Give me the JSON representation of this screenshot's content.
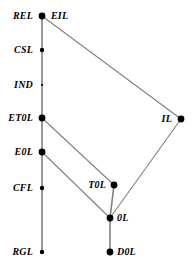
{
  "diagram": {
    "type": "hasse-hierarchy-graph",
    "title": "",
    "canvas": {
      "width": 195,
      "height": 267,
      "background": "#ffffff"
    },
    "style": {
      "edge_color": "#808080",
      "node_color": "#000000",
      "label_color": "#000000",
      "edge_width": 1.1,
      "spine_width": 1.6
    },
    "nodes": [
      {
        "id": "REL",
        "label": "REL",
        "x": 42,
        "y": 16,
        "r": 3.4,
        "label_side": "left",
        "label_dx": 9,
        "label_dy": 0
      },
      {
        "id": "EIL",
        "label": "EIL",
        "x": 42,
        "y": 16,
        "r": 0,
        "label_side": "right",
        "label_dx": 9,
        "label_dy": 0
      },
      {
        "id": "CSL",
        "label": "CSL",
        "x": 42,
        "y": 50,
        "r": 2.2,
        "label_side": "left",
        "label_dx": 9,
        "label_dy": 0
      },
      {
        "id": "IND",
        "label": "IND",
        "x": 42,
        "y": 85,
        "r": 1.1,
        "label_side": "left",
        "label_dx": 9,
        "label_dy": 0
      },
      {
        "id": "ET0L",
        "label": "ET0L",
        "x": 42,
        "y": 118,
        "r": 3.4,
        "label_side": "left",
        "label_dx": 9,
        "label_dy": 0
      },
      {
        "id": "E0L",
        "label": "E0L",
        "x": 42,
        "y": 152,
        "r": 3.4,
        "label_side": "left",
        "label_dx": 9,
        "label_dy": 0
      },
      {
        "id": "CFL",
        "label": "CFL",
        "x": 42,
        "y": 188,
        "r": 2.2,
        "label_side": "left",
        "label_dx": 9,
        "label_dy": 0
      },
      {
        "id": "RGL",
        "label": "RGL",
        "x": 42,
        "y": 252,
        "r": 2.2,
        "label_side": "left",
        "label_dx": 9,
        "label_dy": 0
      },
      {
        "id": "IL",
        "label": "IL",
        "x": 181,
        "y": 119,
        "r": 3.4,
        "label_side": "left",
        "label_dx": 9,
        "label_dy": 0
      },
      {
        "id": "T0L",
        "label": "T0L",
        "x": 114,
        "y": 185,
        "r": 3.4,
        "label_side": "left",
        "label_dx": 8,
        "label_dy": 0
      },
      {
        "id": "0L",
        "label": "0L",
        "x": 110,
        "y": 218,
        "r": 3.4,
        "label_side": "right",
        "label_dx": 7,
        "label_dy": 0
      },
      {
        "id": "D0L",
        "label": "D0L",
        "x": 110,
        "y": 252,
        "r": 3.4,
        "label_side": "right",
        "label_dx": 7,
        "label_dy": 0
      }
    ],
    "edges": [
      {
        "from": "REL",
        "to": "CSL",
        "kind": "spine"
      },
      {
        "from": "CSL",
        "to": "IND",
        "kind": "spine"
      },
      {
        "from": "IND",
        "to": "ET0L",
        "kind": "spine"
      },
      {
        "from": "ET0L",
        "to": "E0L",
        "kind": "spine"
      },
      {
        "from": "E0L",
        "to": "CFL",
        "kind": "spine"
      },
      {
        "from": "CFL",
        "to": "RGL",
        "kind": "spine"
      },
      {
        "from": "REL",
        "to": "IL",
        "kind": "link"
      },
      {
        "from": "IL",
        "to": "0L",
        "kind": "link"
      },
      {
        "from": "ET0L",
        "to": "T0L",
        "kind": "link"
      },
      {
        "from": "E0L",
        "to": "0L",
        "kind": "link"
      },
      {
        "from": "T0L",
        "to": "0L",
        "kind": "spine"
      },
      {
        "from": "0L",
        "to": "D0L",
        "kind": "spine"
      }
    ]
  }
}
